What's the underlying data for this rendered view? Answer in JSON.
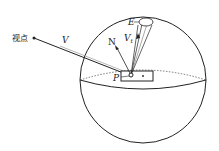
{
  "diagram": {
    "labels": {
      "viewpoint": "视点",
      "view_vector": "V",
      "normal": "N",
      "transmitted_vector": "V",
      "transmitted_sub": "t",
      "eye_point": "E",
      "surface_point": "P",
      "patch_marker": "*"
    },
    "colors": {
      "stroke": "#222222",
      "background": "#ffffff"
    }
  }
}
